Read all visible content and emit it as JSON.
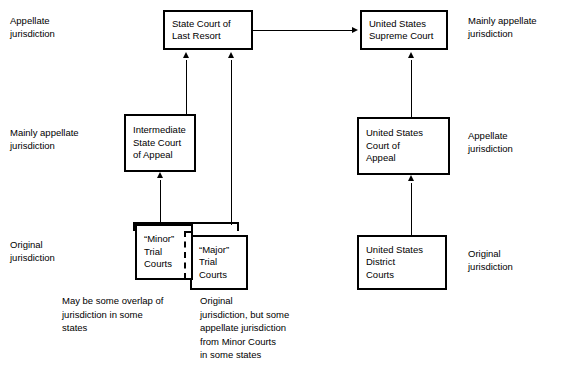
{
  "diagram": {
    "side_labels": {
      "left": [
        {
          "id": "left-appellate",
          "lines": [
            "Appellate",
            "jurisdiction"
          ]
        },
        {
          "id": "left-mainly-appellate",
          "lines": [
            "Mainly appellate",
            "jurisdiction"
          ]
        },
        {
          "id": "left-original",
          "lines": [
            "Original",
            "jurisdiction"
          ]
        }
      ],
      "right": [
        {
          "id": "right-mainly-appellate",
          "lines": [
            "Mainly appellate",
            "jurisdiction"
          ]
        },
        {
          "id": "right-appellate",
          "lines": [
            "Appellate",
            "jurisdiction"
          ]
        },
        {
          "id": "right-original",
          "lines": [
            "Original",
            "jurisdiction"
          ]
        }
      ]
    },
    "boxes": {
      "state_last_resort": {
        "lines": [
          "State Court of",
          "Last Resort"
        ]
      },
      "us_supreme_court": {
        "lines": [
          "United States",
          "Supreme Court"
        ]
      },
      "intermediate_state_appeal": {
        "lines": [
          "Intermediate",
          "State Court",
          "of Appeal"
        ]
      },
      "us_court_of_appeal": {
        "lines": [
          "United States",
          "Court of",
          "Appeal"
        ]
      },
      "minor_trial_courts": {
        "lines": [
          "“Minor”",
          "Trial",
          "Courts"
        ]
      },
      "major_trial_courts": {
        "lines": [
          "“Major”",
          "Trial",
          "Courts"
        ]
      },
      "us_district_courts": {
        "lines": [
          "United States",
          "District",
          "Courts"
        ]
      }
    },
    "notes": {
      "overlap_note": {
        "lines": [
          "May be some overlap of",
          "jurisdiction in some",
          "states"
        ]
      },
      "major_note": {
        "lines": [
          "Original",
          "jurisdiction, but some",
          "appellate jurisdiction",
          "from Minor Courts",
          "in some states"
        ]
      }
    },
    "colors": {
      "stroke": "#000000",
      "background": "#ffffff",
      "text": "#000000"
    }
  }
}
